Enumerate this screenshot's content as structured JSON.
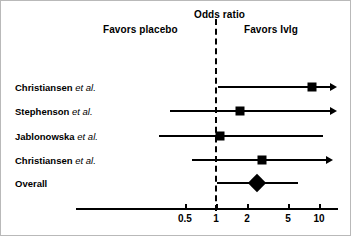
{
  "chart_data": {
    "type": "forest",
    "title": "Odds ratio",
    "xlabel": "Odds ratio",
    "ylabel": "",
    "scale": "log",
    "xlim": [
      0.33,
      13
    ],
    "null_value": 1,
    "grid": false,
    "favors_left_label": "Favors placebo",
    "favors_right_label": "Favors Ivlg",
    "tick_labels": [
      "0.5",
      "1",
      "2",
      "5",
      "10"
    ],
    "tick_values": [
      0.5,
      1,
      2,
      5,
      10
    ],
    "categories": [
      "Christiansen et al.",
      "Stephenson et al.",
      "Jablonowska et al.",
      "Christiansen et al.",
      "Overall"
    ],
    "rows": [
      {
        "name": "Christiansen",
        "suffix": "et al.",
        "estimate": 8.5,
        "ci_low": 1.05,
        "ci_high": 13.0,
        "arrow_right": true,
        "arrow_left": false,
        "marker": "square"
      },
      {
        "name": "Stephenson",
        "suffix": "et al.",
        "estimate": 1.7,
        "ci_low": 0.36,
        "ci_high": 13.0,
        "arrow_right": true,
        "arrow_left": false,
        "marker": "square"
      },
      {
        "name": "Jablonowska",
        "suffix": "et al.",
        "estimate": 1.1,
        "ci_low": 0.28,
        "ci_high": 11.0,
        "arrow_right": false,
        "arrow_left": false,
        "marker": "square"
      },
      {
        "name": "Christiansen",
        "suffix": "et al.",
        "estimate": 2.8,
        "ci_low": 0.58,
        "ci_high": 12.0,
        "arrow_right": true,
        "arrow_left": false,
        "marker": "square"
      },
      {
        "name": "Overall",
        "suffix": "",
        "estimate": 2.5,
        "ci_low": 1.03,
        "ci_high": 6.2,
        "arrow_right": false,
        "arrow_left": false,
        "marker": "diamond"
      }
    ]
  }
}
